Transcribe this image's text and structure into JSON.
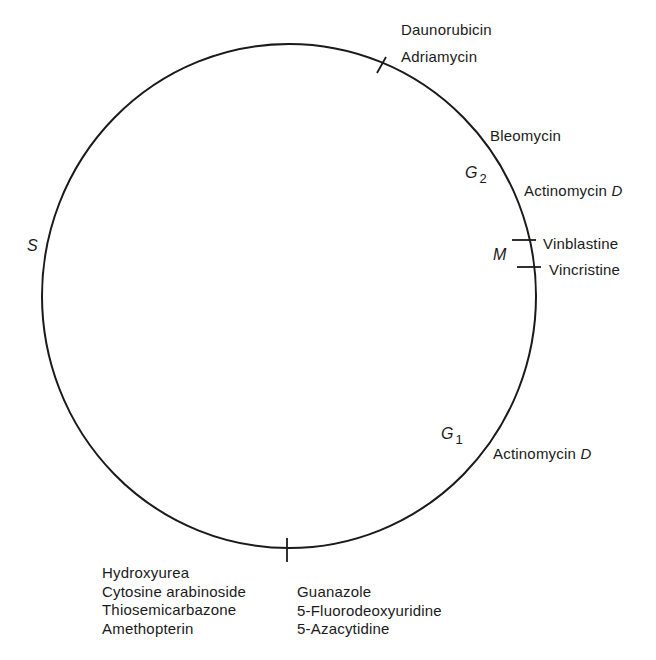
{
  "diagram": {
    "type": "cell-cycle",
    "phases": {
      "S": {
        "label": "S"
      },
      "G2": {
        "label": "G",
        "sub": "2"
      },
      "M": {
        "label": "M"
      },
      "G1": {
        "label": "G",
        "sub": "1"
      }
    },
    "drugs": {
      "top": [
        "Daunorubicin",
        "Adriamycin"
      ],
      "g2": {
        "bleomycin": "Bleomycin",
        "actinomycin_main": "Actinomycin ",
        "actinomycin_italic": "D"
      },
      "m": [
        "Vinblastine",
        "Vincristine"
      ],
      "g1": {
        "actinomycin_main": "Actinomycin ",
        "actinomycin_italic": "D"
      },
      "bottom_left": [
        "Hydroxyurea",
        "Cytosine arabinoside",
        "Thiosemicarbazone",
        "Amethopterin"
      ],
      "bottom_right": [
        "Guanazole",
        "5-Fluorodeoxyuridine",
        "5-Azacytidine"
      ]
    }
  }
}
